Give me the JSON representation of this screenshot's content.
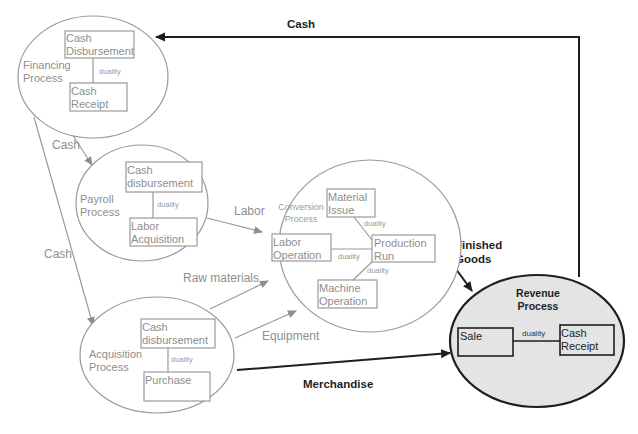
{
  "diagram": {
    "type": "REA value chain diagram",
    "colors": {
      "background": "#ffffff",
      "inactive_stroke": "#9a9a9a",
      "inactive_text": "#8e8e8e",
      "active_stroke": "#1e1e1e",
      "active_fill": "#e4e4e4"
    },
    "processes": {
      "financing": {
        "label_line1": "Financing",
        "label_line2": "Process",
        "event_top_line1": "Cash",
        "event_top_line2": "Disbursement",
        "event_bottom_line1": "Cash",
        "event_bottom_line2": "Receipt",
        "relation": "duality"
      },
      "payroll": {
        "label_line1": "Payroll",
        "label_line2": "Process",
        "event_top_line1": "Cash",
        "event_top_line2": "disbursement",
        "event_bottom_line1": "Labor",
        "event_bottom_line2": "Acquisition",
        "relation": "duality"
      },
      "conversion": {
        "label_line1": "Conversion",
        "label_line2": "Process",
        "event_material_line1": "Material",
        "event_material_line2": "Issue",
        "event_labor_line1": "Labor",
        "event_labor_line2": "Operation",
        "event_production_line1": "Production",
        "event_production_line2": "Run",
        "event_machine_line1": "Machine",
        "event_machine_line2": "Operation",
        "relation_material": "duality",
        "relation_labor": "duality",
        "relation_machine": "duality"
      },
      "acquisition": {
        "label_line1": "Acquisition",
        "label_line2": "Process",
        "event_top_line1": "Cash",
        "event_top_line2": "disbursement",
        "event_bottom_line1": "Purchase",
        "relation": "duality"
      },
      "revenue": {
        "label_line1": "Revenue",
        "label_line2": "Process",
        "event_left_line1": "Sale",
        "event_right_line1": "Cash",
        "event_right_line2": "Receipt",
        "relation": "duality"
      }
    },
    "flows": {
      "cash_top": "Cash",
      "cash_financing_to_payroll": "Cash",
      "cash_financing_to_acquisition": "Cash",
      "labor": "Labor",
      "raw_materials": "Raw materials",
      "equipment": "Equipment",
      "finished_goods_line1": "Finished",
      "finished_goods_line2": "Goods",
      "merchandise": "Merchandise"
    }
  }
}
